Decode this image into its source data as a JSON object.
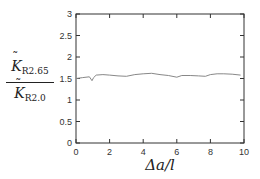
{
  "chart_data": {
    "type": "line",
    "title": "",
    "xlabel": "Δa/l",
    "ylabel": "K̃_R2.65 / K̃_R2.0",
    "ylabel_parts": {
      "numerator": "K",
      "numerator_sub": "R2.65",
      "denominator": "K",
      "denominator_sub": "R2.0"
    },
    "xlim": [
      0,
      10
    ],
    "ylim": [
      0,
      3
    ],
    "xticks": [
      0,
      2,
      4,
      6,
      8,
      10
    ],
    "xtick_labels": [
      "0",
      "2",
      "4",
      "6",
      "8",
      "10"
    ],
    "yticks": [
      0,
      0.5,
      1,
      1.5,
      2,
      2.5,
      3
    ],
    "ytick_labels": [
      "0",
      "0.5",
      "1",
      "1.5",
      "2",
      "2.5",
      "3"
    ],
    "grid": false,
    "legend": null,
    "series": [
      {
        "name": "ratio",
        "color": "#888888",
        "x": [
          0,
          0.4,
          0.8,
          0.95,
          1.05,
          1.2,
          1.6,
          2.0,
          2.5,
          3.0,
          3.5,
          4.0,
          4.5,
          5.0,
          5.5,
          6.0,
          6.3,
          6.8,
          7.3,
          7.7,
          8.0,
          8.4,
          8.8,
          9.3,
          9.8
        ],
        "y": [
          1.5,
          1.52,
          1.54,
          1.45,
          1.52,
          1.58,
          1.59,
          1.58,
          1.56,
          1.55,
          1.59,
          1.61,
          1.62,
          1.59,
          1.57,
          1.53,
          1.57,
          1.57,
          1.56,
          1.55,
          1.59,
          1.61,
          1.61,
          1.6,
          1.58
        ]
      }
    ]
  }
}
